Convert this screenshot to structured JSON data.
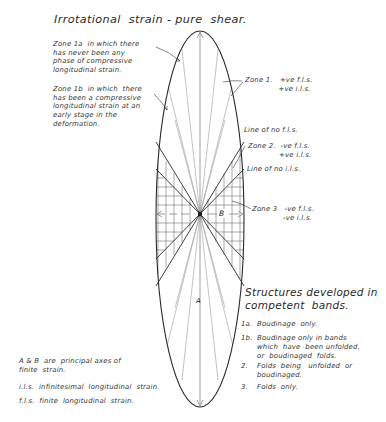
{
  "title": "Irrotational  strain - pure  shear.",
  "zone_annotations": {
    "zone_1a": "Zone 1a  in which there\nhas never been any\nphase of compressive\nlongitudinal strain.",
    "zone_1b": "Zone 1b  in which  there\nhas been a compressive\nlongitudinal strain at an\nearly stage in the\ndeformation.",
    "zone_1": "Zone 1.   +ve f.l.s.\n              +ve i.l.s.",
    "line_no_fls": "Line of no f.l.s.",
    "zone_2": "Zone 2.  -ve f.l.s.\n             +ve i.l.s.",
    "line_no_ils": "Line of no i.l.s.",
    "zone_3": "Zone 3   -ve f.l.s.\n             -ve i.l.s."
  },
  "axes": {
    "a_label": "A",
    "b_label": "B"
  },
  "structures": {
    "heading": "Structures developed in\ncompetent  bands.",
    "items": [
      {
        "num": "1a.",
        "text": "Boudinage  only."
      },
      {
        "num": "1b.",
        "text": "Boudinage only in bands\nwhich  have  been unfolded,\nor  boudinaged  folds."
      },
      {
        "num": "2.",
        "text": "Folds  being   unfolded  or\nboudinaged."
      },
      {
        "num": "3.",
        "text": "Folds  only."
      }
    ]
  },
  "legend": {
    "principal_axes": "A & B  are  principal axes of\nfinite  strain.",
    "ils": "i.l.s.  infinitesimal  longitudinal  strain.",
    "fls": "f.l.s.  finite  longitudinal  strain."
  },
  "colors": {
    "ink": "#2a2a2a",
    "light_line": "#9a9a9a",
    "background": "#ffffff"
  }
}
